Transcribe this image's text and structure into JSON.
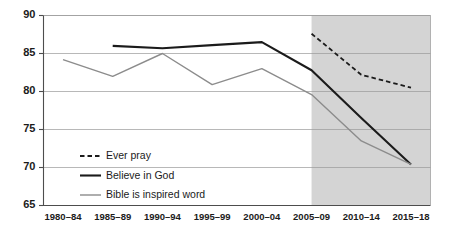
{
  "chart_data": {
    "type": "line",
    "title": "",
    "subtitle": "",
    "xlabel": "",
    "ylabel": "",
    "categories": [
      "1980–84",
      "1985–89",
      "1990–94",
      "1995–99",
      "2000–04",
      "2005–09",
      "2010–14",
      "2015–18"
    ],
    "ylim": [
      65,
      90
    ],
    "yticks": [
      65,
      70,
      75,
      80,
      85,
      90
    ],
    "ytick_labels": [
      "65",
      "70",
      "75",
      "80",
      "85",
      "90"
    ],
    "grid": true,
    "grid_axis": "y",
    "legend_position": "inside-lower-left",
    "shaded_region": {
      "label": "",
      "from_category": "2005–09",
      "to_category": "2015–18",
      "color": "#d4d4d4"
    },
    "series": [
      {
        "name": "Ever pray",
        "style": "dashed",
        "color": "#1b1b1b",
        "width": 1.8,
        "values": [
          null,
          null,
          null,
          null,
          null,
          87.6,
          82.2,
          80.5
        ]
      },
      {
        "name": "Believe in God",
        "style": "solid",
        "color": "#1b1b1b",
        "width": 2.1,
        "values": [
          null,
          86.0,
          85.7,
          86.1,
          86.5,
          82.8,
          76.5,
          70.4
        ]
      },
      {
        "name": "Bible is inspired word",
        "style": "solid",
        "color": "#8c8c8c",
        "width": 1.4,
        "values": [
          84.2,
          82.0,
          85.0,
          80.9,
          83.0,
          79.6,
          73.5,
          70.4
        ]
      }
    ]
  },
  "legend": {
    "items": [
      {
        "label": "Ever pray",
        "swatch": "dashed-line-swatch"
      },
      {
        "label": "Believe in God",
        "swatch": "thick-solid-line-swatch"
      },
      {
        "label": "Bible is inspired word",
        "swatch": "gray-solid-line-swatch"
      }
    ]
  },
  "colors": {
    "background": "#ffffff",
    "shade": "#d4d4d4",
    "axis": "#4d4d4d",
    "grid": "#9a9a9a",
    "dark_series": "#1b1b1b",
    "gray_series": "#8c8c8c",
    "text": "#1b1b1b"
  }
}
